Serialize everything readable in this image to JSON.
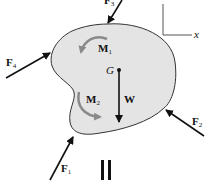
{
  "diagram": {
    "type": "free-body-diagram",
    "body_fill": "#e4e4e4",
    "body_stroke": "#333333",
    "moment_color": "#8a8a8a",
    "force_color": "#111111",
    "axes": {
      "x_label": "x"
    },
    "center_of_gravity": {
      "label": "G"
    },
    "weight": {
      "label": "W"
    },
    "moments": [
      {
        "id": "M1",
        "main": "M",
        "sub": "1",
        "direction": "counterclockwise"
      },
      {
        "id": "M2",
        "main": "M",
        "sub": "2",
        "direction": "counterclockwise"
      }
    ],
    "forces": [
      {
        "id": "F1",
        "main": "F",
        "sub": "1"
      },
      {
        "id": "F2",
        "main": "F",
        "sub": "2"
      },
      {
        "id": "F3",
        "main": "F",
        "sub": "3"
      },
      {
        "id": "F4",
        "main": "F",
        "sub": "4"
      }
    ],
    "equality_symbol": "||"
  }
}
